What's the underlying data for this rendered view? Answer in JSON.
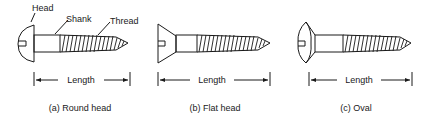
{
  "figure": {
    "panels": [
      {
        "id": "a",
        "caption": "(a) Round head",
        "dimension_label": "Length",
        "part_labels": {
          "head": "Head",
          "shank": "Shank",
          "thread": "Thread"
        }
      },
      {
        "id": "b",
        "caption": "(b) Flat head",
        "dimension_label": "Length"
      },
      {
        "id": "c",
        "caption": "(c) Oval",
        "dimension_label": "Length"
      }
    ]
  }
}
